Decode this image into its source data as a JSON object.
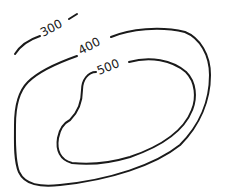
{
  "diagram": {
    "type": "contour-map",
    "contours": [
      {
        "value": 300,
        "label": "300"
      },
      {
        "value": 400,
        "label": "400"
      },
      {
        "value": 500,
        "label": "500"
      }
    ],
    "line_color": "#1a1a1a",
    "background": "#ffffff"
  }
}
